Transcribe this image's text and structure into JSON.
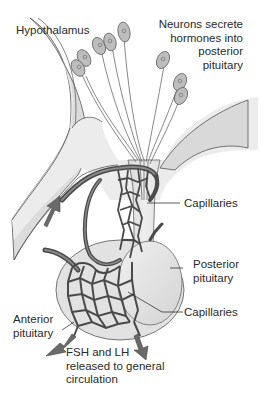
{
  "diagram": {
    "colors": {
      "background": "#ffffff",
      "tissue_light": "#e6e6e6",
      "tissue_mid": "#d0d0d0",
      "outline": "#555555",
      "vessel": "#5c5c5c",
      "vessel_dark": "#3a3a3a",
      "neuron_body": "#b8b8b8",
      "arrow": "#6a6a6a",
      "text": "#2a2a2a"
    },
    "labels": {
      "hypothalamus": "Hypothalamus",
      "neurons": [
        "Neurons secrete",
        "hormones into",
        "posterior",
        "pituitary"
      ],
      "capillaries_upper": "Capillaries",
      "posterior_pituitary": [
        "Posterior",
        "pituitary"
      ],
      "capillaries_lower": "Capillaries",
      "anterior_pituitary": [
        "Anterior",
        "pituitary"
      ],
      "release": [
        "FSH and LH",
        "released to general",
        "circulation"
      ]
    },
    "neuron_count": 9,
    "arrows": [
      {
        "name": "portal-inflow-arrow",
        "direction": "up-left"
      },
      {
        "name": "release-arrow-left",
        "direction": "down-left"
      },
      {
        "name": "release-arrow-right",
        "direction": "down"
      }
    ]
  }
}
